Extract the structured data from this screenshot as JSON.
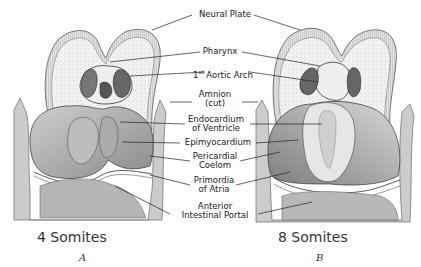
{
  "figure": {
    "type": "anatomical illustration",
    "labels": [
      {
        "id": "neural-plate",
        "text": "Neural Plate"
      },
      {
        "id": "pharynx",
        "text": "Pharynx"
      },
      {
        "id": "aortic-arch",
        "text_prefix": "1",
        "text_sup": "st",
        "text_suffix": " Aortic Arch"
      },
      {
        "id": "amnion",
        "line1": "Amnion",
        "line2": "(cut)"
      },
      {
        "id": "endocardium",
        "line1": "Endocardium",
        "line2": "of Ventricle"
      },
      {
        "id": "epimyocardium",
        "text": "Epimyocardium"
      },
      {
        "id": "pericardial",
        "line1": "Pericardial",
        "line2": "Coelom"
      },
      {
        "id": "primordia",
        "line1": "Primordia",
        "line2": "of Atria"
      },
      {
        "id": "portal",
        "line1": "Anterior",
        "line2": "Intestinal Portal"
      }
    ],
    "panels": [
      {
        "id": "A",
        "caption": "4 Somites",
        "letter": "A"
      },
      {
        "id": "B",
        "caption": "8 Somites",
        "letter": "B"
      }
    ]
  }
}
